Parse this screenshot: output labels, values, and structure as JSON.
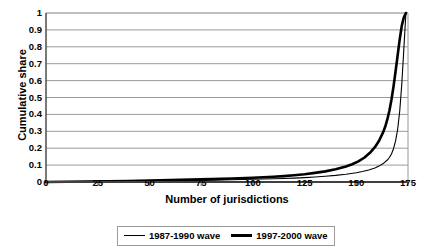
{
  "chart_data": {
    "type": "line",
    "title": "",
    "xlabel": "Number of jurisdictions",
    "ylabel": "Cumulative share",
    "xlim": [
      0,
      175
    ],
    "ylim": [
      0,
      1
    ],
    "grid": true,
    "legend_position": "bottom",
    "xticks": [
      "0",
      "25",
      "50",
      "75",
      "100",
      "125",
      "150",
      "175"
    ],
    "xtick_values": [
      0,
      25,
      50,
      75,
      100,
      125,
      150,
      175
    ],
    "yticks": [
      "0",
      "0.1",
      "0.2",
      "0.3",
      "0.4",
      "0.5",
      "0.6",
      "0.7",
      "0.8",
      "0.9",
      "1"
    ],
    "ytick_values": [
      0,
      0.1,
      0.2,
      0.3,
      0.4,
      0.5,
      0.6,
      0.7,
      0.8,
      0.9,
      1
    ],
    "series": [
      {
        "name": "1987-1990 wave",
        "style": "thin",
        "color": "#000000",
        "x": [
          0,
          10,
          20,
          30,
          40,
          50,
          60,
          70,
          80,
          90,
          100,
          110,
          115,
          120,
          125,
          130,
          135,
          140,
          145,
          150,
          153,
          156,
          159,
          161,
          163,
          165,
          166,
          167,
          168,
          169,
          170,
          171,
          172,
          173,
          174
        ],
        "y": [
          0,
          0.001,
          0.002,
          0.003,
          0.004,
          0.005,
          0.007,
          0.009,
          0.011,
          0.013,
          0.016,
          0.019,
          0.021,
          0.023,
          0.026,
          0.03,
          0.034,
          0.039,
          0.046,
          0.055,
          0.062,
          0.071,
          0.083,
          0.094,
          0.109,
          0.13,
          0.145,
          0.166,
          0.197,
          0.243,
          0.312,
          0.42,
          0.58,
          0.79,
          1.0
        ]
      },
      {
        "name": "1997-2000 wave",
        "style": "thick",
        "color": "#000000",
        "x": [
          0,
          10,
          20,
          30,
          40,
          50,
          60,
          70,
          80,
          90,
          100,
          110,
          115,
          120,
          125,
          130,
          135,
          140,
          145,
          148,
          151,
          154,
          157,
          159,
          161,
          163,
          164,
          165,
          166,
          167,
          168,
          169,
          170,
          171,
          172,
          173,
          174
        ],
        "y": [
          0,
          0.0015,
          0.003,
          0.0045,
          0.006,
          0.008,
          0.011,
          0.014,
          0.017,
          0.021,
          0.025,
          0.031,
          0.035,
          0.04,
          0.046,
          0.054,
          0.063,
          0.075,
          0.092,
          0.105,
          0.122,
          0.145,
          0.178,
          0.206,
          0.244,
          0.295,
          0.328,
          0.37,
          0.422,
          0.487,
          0.565,
          0.655,
          0.75,
          0.845,
          0.925,
          0.975,
          1.0
        ]
      }
    ]
  },
  "legend": {
    "items": [
      {
        "label": "1987-1990 wave"
      },
      {
        "label": "1997-2000 wave"
      }
    ]
  }
}
